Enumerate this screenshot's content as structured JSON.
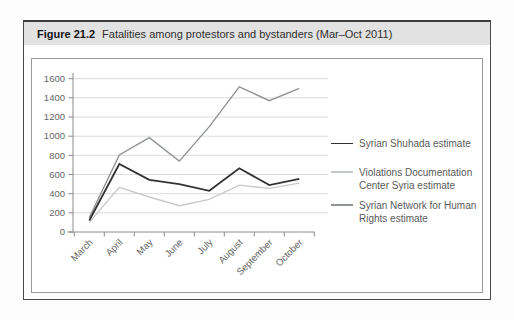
{
  "figure": {
    "label": "Figure 21.2",
    "title": "Fatalities among protestors and bystanders (Mar–Oct 2011)"
  },
  "chart_data": {
    "type": "line",
    "title": "Fatalities among protestors and bystanders (Mar–Oct 2011)",
    "categories": [
      "March",
      "April",
      "May",
      "June",
      "July",
      "August",
      "September",
      "October"
    ],
    "series": [
      {
        "name": "Syrian Shuhada estimate",
        "color": "#333333",
        "stroke_width": 1.8,
        "values": [
          120,
          710,
          545,
          500,
          430,
          665,
          490,
          555
        ]
      },
      {
        "name": "Violations Documentation Center Syria estimate",
        "color": "#c7cacb",
        "stroke_width": 1.4,
        "values": [
          100,
          465,
          365,
          275,
          340,
          490,
          455,
          510
        ]
      },
      {
        "name": "Syrian Network for Human Rights estimate",
        "color": "#909496",
        "stroke_width": 1.4,
        "values": [
          150,
          805,
          985,
          740,
          1100,
          1515,
          1370,
          1500
        ]
      }
    ],
    "xlabel": "",
    "ylabel": "",
    "ylim": [
      0,
      1600
    ],
    "ytick_step": 200,
    "grid": true,
    "gridline_color": "#dbdbdb",
    "axis_color": "#8c8c8c",
    "tick_label_color": "#666666",
    "legend_position": "right"
  }
}
